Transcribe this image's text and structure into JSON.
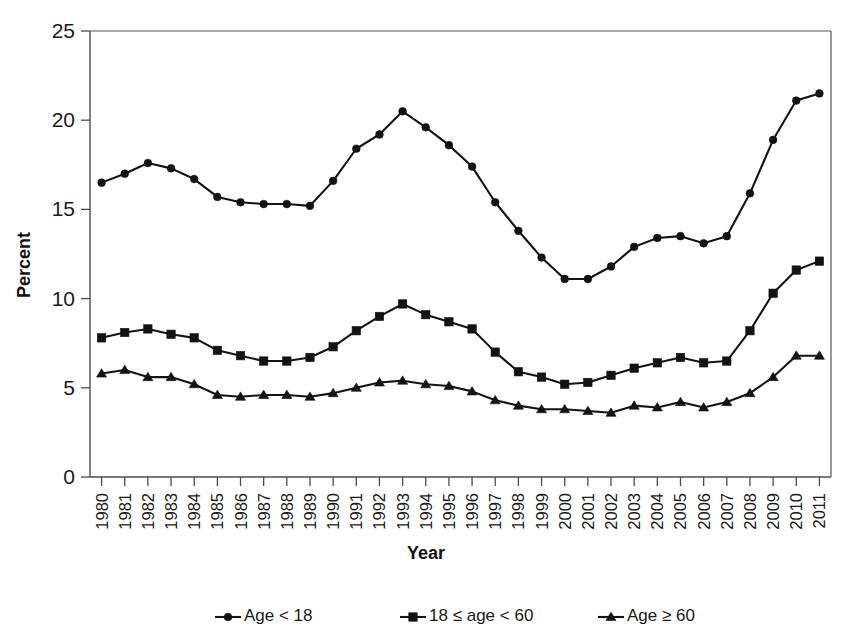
{
  "chart_data": {
    "type": "line",
    "title": "",
    "xlabel": "Year",
    "ylabel": "Percent",
    "ylim": [
      0,
      25
    ],
    "yticks": [
      0,
      5,
      10,
      15,
      20,
      25
    ],
    "grid": false,
    "legend_position": "bottom",
    "categories": [
      "1980",
      "1981",
      "1982",
      "1983",
      "1984",
      "1985",
      "1986",
      "1987",
      "1988",
      "1989",
      "1990",
      "1991",
      "1992",
      "1993",
      "1994",
      "1995",
      "1996",
      "1997",
      "1998",
      "1999",
      "2000",
      "2001",
      "2002",
      "2003",
      "2004",
      "2005",
      "2006",
      "2007",
      "2008",
      "2009",
      "2010",
      "2011"
    ],
    "series": [
      {
        "name": "Age < 18",
        "marker": "circle",
        "values": [
          16.5,
          17.0,
          17.6,
          17.3,
          16.7,
          15.7,
          15.4,
          15.3,
          15.3,
          15.2,
          16.6,
          18.4,
          19.2,
          20.5,
          19.6,
          18.6,
          17.4,
          15.4,
          13.8,
          12.3,
          11.1,
          11.1,
          11.8,
          12.9,
          13.4,
          13.5,
          13.1,
          13.5,
          15.9,
          18.9,
          21.1,
          21.5
        ]
      },
      {
        "name": "18 ≤ age < 60",
        "marker": "square",
        "values": [
          7.8,
          8.1,
          8.3,
          8.0,
          7.8,
          7.1,
          6.8,
          6.5,
          6.5,
          6.7,
          7.3,
          8.2,
          9.0,
          9.7,
          9.1,
          8.7,
          8.3,
          7.0,
          5.9,
          5.6,
          5.2,
          5.3,
          5.7,
          6.1,
          6.4,
          6.7,
          6.4,
          6.5,
          8.2,
          10.3,
          11.6,
          12.1
        ]
      },
      {
        "name": "Age ≥ 60",
        "marker": "triangle",
        "values": [
          5.8,
          6.0,
          5.6,
          5.6,
          5.2,
          4.6,
          4.5,
          4.6,
          4.6,
          4.5,
          4.7,
          5.0,
          5.3,
          5.4,
          5.2,
          5.1,
          4.8,
          4.3,
          4.0,
          3.8,
          3.8,
          3.7,
          3.6,
          4.0,
          3.9,
          4.2,
          3.9,
          4.2,
          4.7,
          5.6,
          6.8,
          6.8
        ]
      }
    ]
  },
  "legend": {
    "items": [
      {
        "label": "Age < 18",
        "marker": "circle"
      },
      {
        "label": "18 ≤ age < 60",
        "marker": "square"
      },
      {
        "label": "Age ≥ 60",
        "marker": "triangle"
      }
    ]
  }
}
